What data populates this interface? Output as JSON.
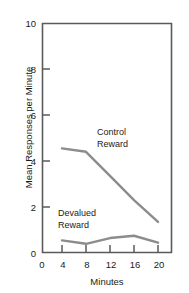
{
  "chart_data": {
    "type": "line",
    "title": "",
    "xlabel": "Minutes",
    "ylabel": "Mean Responses per Minute",
    "x": [
      4,
      8,
      12,
      16,
      20
    ],
    "xlim": [
      0,
      22
    ],
    "ylim": [
      0,
      10
    ],
    "xticks": [
      0,
      4,
      8,
      12,
      16,
      20
    ],
    "yticks": [
      0,
      2,
      4,
      6,
      8,
      10
    ],
    "xtick_labels": [
      "0",
      "4",
      "8",
      "12",
      "16",
      "20"
    ],
    "ytick_labels": [
      "0",
      "2",
      "4",
      "6",
      "8",
      "10"
    ],
    "grid": false,
    "legend": "inline-annotations",
    "line_color": "#8c8c8c",
    "axis_color": "#5a5a5a",
    "series": [
      {
        "name": "Control Reward",
        "values": [
          4.55,
          4.4,
          3.35,
          2.3,
          1.35
        ],
        "annotation": "Control\nReward",
        "annotation_line1": "Control",
        "annotation_line2": "Reward"
      },
      {
        "name": "Devalued Reward",
        "values": [
          0.55,
          0.4,
          0.65,
          0.75,
          0.45
        ],
        "annotation": "Devalued\nReward",
        "annotation_line1": "Devalued",
        "annotation_line2": "Reward"
      }
    ]
  }
}
